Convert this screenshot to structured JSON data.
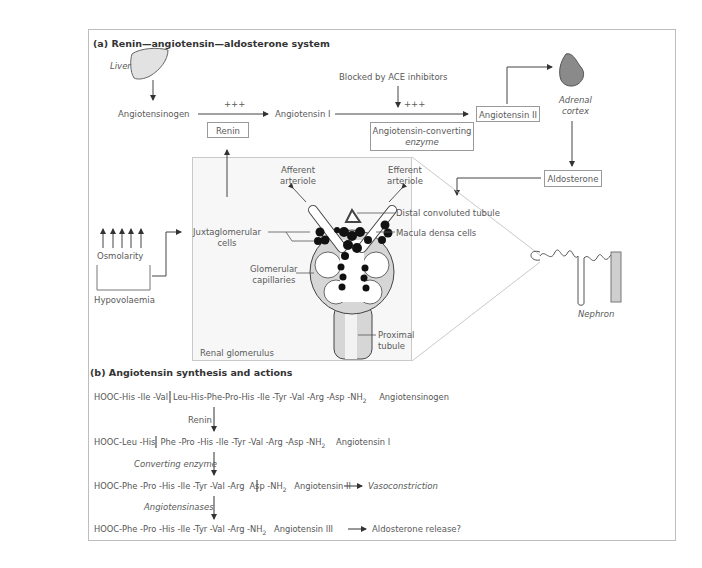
{
  "panel_a": {
    "title": "(a)  Renin—angiotensin—aldosterone system",
    "liver_label": "Liver",
    "angiotensinogen": "Angiotensinogen",
    "plus1": "+++",
    "renin": "Renin",
    "angiotensin_i": "Angiotensin I",
    "blocked_label": "Blocked by ACE inhibitors",
    "plus2": "+++",
    "ace_line1": "Angiotensin-converting",
    "ace_line2": "enzyme",
    "angiotensin_ii": "Angiotensin II",
    "adrenal_line1": "Adrenal",
    "adrenal_line2": "cortex",
    "aldosterone": "Aldosterone",
    "osmolarity": "Osmolarity",
    "hypovolaemia": "Hypovolaemia",
    "juxta_line1": "Juxtaglomerular",
    "juxta_line2": "cells",
    "afferent_line1": "Afferent",
    "afferent_line2": "arteriole",
    "efferent_line1": "Efferent",
    "efferent_line2": "arteriole",
    "distal": "Distal convoluted tubule",
    "macula": "Macula densa cells",
    "glom_line1": "Glomerular",
    "glom_line2": "capillaries",
    "proximal_line1": "Proximal",
    "proximal_line2": "tubule",
    "renal_glomerulus": "Renal glomerulus",
    "nephron": "Nephron"
  },
  "panel_b": {
    "title": "(b)  Angiotensin synthesis and actions",
    "rows": [
      {
        "left": "HOOC-His -Ile -Val",
        "right": "Leu-His-Phe-Pro-His -Ile -Tyr -Val -Arg -Asp -NH",
        "sub": "2",
        "name": "Angiotensinogen",
        "effect": ""
      },
      {
        "left": "HOOC-Leu -His",
        "right": "Phe -Pro -His -Ile -Tyr -Val -Arg -Asp -NH",
        "sub": "2",
        "name": "Angiotensin I",
        "effect": ""
      },
      {
        "left": "HOOC-Phe -Pro -His -Ile -Tyr -Val -Arg",
        "right": "Asp -NH",
        "sub": "2",
        "name": "Angiotensin II",
        "effect": "Vasoconstriction"
      },
      {
        "left": "HOOC-Phe -Pro -His -Ile -Tyr -Val -Arg -NH",
        "right": "",
        "sub": "2",
        "name": "Angiotensin III",
        "effect": "Aldosterone release?"
      }
    ],
    "enzymes": [
      "Renin",
      "Converting enzyme",
      "Angiotensinases"
    ]
  }
}
